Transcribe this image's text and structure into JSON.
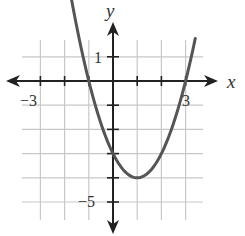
{
  "chart_data": {
    "type": "line",
    "title": "",
    "xlabel": "x",
    "ylabel": "y",
    "xlim": [
      -4,
      3.5
    ],
    "ylim": [
      -5.7,
      1.7
    ],
    "grid": true,
    "x_tick_labels": [
      {
        "value": -3,
        "label": "−3"
      },
      {
        "value": 3,
        "label": "3"
      }
    ],
    "y_tick_labels": [
      {
        "value": 1,
        "label": "1"
      },
      {
        "value": -5,
        "label": "−5"
      }
    ],
    "series": [
      {
        "name": "parabola",
        "equation": "y = x^2 - 2x - 3",
        "x_intercepts": [
          -1,
          3
        ],
        "y_intercept": -3,
        "vertex": [
          1,
          -4
        ],
        "x": [
          -1.8,
          -1.5,
          -1,
          -0.5,
          0,
          0.5,
          1,
          1.5,
          2,
          2.5,
          3,
          3.4
        ],
        "values": [
          3.84,
          2.25,
          0,
          -1.75,
          -3,
          -3.75,
          -4,
          -3.75,
          -3,
          -1.75,
          0,
          1.76
        ]
      }
    ]
  },
  "labels": {
    "x_axis": "x",
    "y_axis": "y",
    "tick_neg3": "−3",
    "tick_3": "3",
    "tick_1": "1",
    "tick_neg5": "−5"
  },
  "colors": {
    "grid": "#c8c8c8",
    "axis": "#222222",
    "curve": "#555555"
  }
}
